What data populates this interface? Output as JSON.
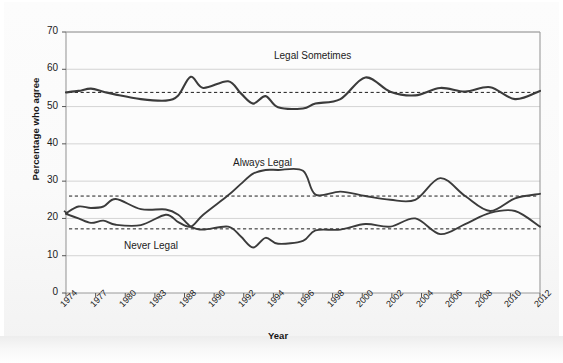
{
  "figure": {
    "background_color": "#fbfbfb",
    "line_color": "#3b3b3b",
    "dashed_color": "#1d1d1d",
    "grid_color": "#cfcfcf",
    "axis_color": "#9a9a9a"
  },
  "chart_data": {
    "type": "line",
    "title": "",
    "xlabel": "Year",
    "ylabel": "Percentage who agree",
    "ylim": [
      0,
      70
    ],
    "yticks": [
      0,
      10,
      20,
      30,
      40,
      50,
      60,
      70
    ],
    "grid": true,
    "legend_position": "inline-annotations",
    "xtick_labels": [
      "1974",
      "1977",
      "1980",
      "1983",
      "1988",
      "1990",
      "1992",
      "1994",
      "1996",
      "1998",
      "2000",
      "2002",
      "2004",
      "2006",
      "2008",
      "2010",
      "2012"
    ],
    "x": [
      1974,
      1975,
      1976,
      1977,
      1978,
      1980,
      1982,
      1983,
      1984,
      1985,
      1987,
      1988,
      1989,
      1990,
      1991,
      1993,
      1994,
      1996,
      1998,
      2000,
      2002,
      2004,
      2006,
      2008,
      2010,
      2012
    ],
    "series": [
      {
        "name": "Legal Sometimes",
        "label": "Legal Sometimes",
        "mean_reference": 53.8,
        "values": [
          53.8,
          54.2,
          54.8,
          54.0,
          53.2,
          52.0,
          51.6,
          53.0,
          58.0,
          55.0,
          56.8,
          53.6,
          50.8,
          52.8,
          49.8,
          49.5,
          50.8,
          52.0,
          57.8,
          54.0,
          53.0,
          55.0,
          54.0,
          55.2,
          52.0,
          54.2
        ]
      },
      {
        "name": "Always Legal",
        "label": "Always Legal",
        "mean_reference": 26.0,
        "values": [
          21.2,
          20.0,
          18.8,
          19.4,
          18.3,
          18.2,
          21.0,
          19.0,
          17.8,
          21.0,
          26.2,
          29.2,
          32.0,
          33.0,
          33.0,
          32.8,
          26.4,
          27.2,
          26.0,
          25.0,
          25.0,
          30.8,
          26.0,
          22.0,
          25.4,
          26.6
        ]
      },
      {
        "name": "Never Legal",
        "label": "Never Legal",
        "mean_reference": 17.2,
        "values": [
          21.4,
          23.2,
          22.8,
          23.2,
          25.2,
          22.5,
          22.4,
          21.0,
          17.8,
          17.0,
          17.8,
          15.2,
          12.2,
          14.8,
          13.2,
          14.0,
          16.8,
          17.0,
          18.5,
          17.8,
          20.0,
          15.8,
          18.5,
          21.5,
          22.0,
          17.8
        ]
      }
    ]
  }
}
